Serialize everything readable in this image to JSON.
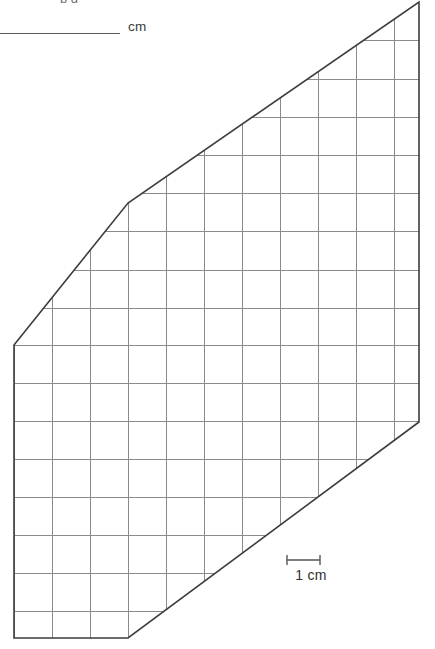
{
  "worksheet": {
    "prompt_partial": "p  g",
    "answer_blank_unit": "cm",
    "scale_label": "1 cm"
  },
  "figure": {
    "stroke_color": "#3d3d3d",
    "grid_color": "#8a8a8a",
    "fill_color": "#ffffff",
    "grid_spacing_px": 38,
    "grid_spacing_cm": 1,
    "outline_vertices": [
      [
        14,
        345
      ],
      [
        128,
        203
      ],
      [
        419,
        2
      ],
      [
        419,
        422
      ],
      [
        128,
        638
      ],
      [
        14,
        638
      ]
    ],
    "grid_x_lines": [
      14,
      52,
      90,
      128,
      166,
      204,
      242,
      280,
      318,
      356,
      394,
      419
    ],
    "grid_y_lines": [
      2,
      40,
      79,
      117,
      155,
      193,
      203,
      231,
      270,
      308,
      345,
      357,
      395,
      433,
      471,
      509,
      548,
      586,
      624,
      638
    ]
  },
  "scale": {
    "bar_x_start": 287,
    "bar_x_end": 320,
    "bar_y": 560,
    "cap_height": 10,
    "label": "1 cm"
  }
}
